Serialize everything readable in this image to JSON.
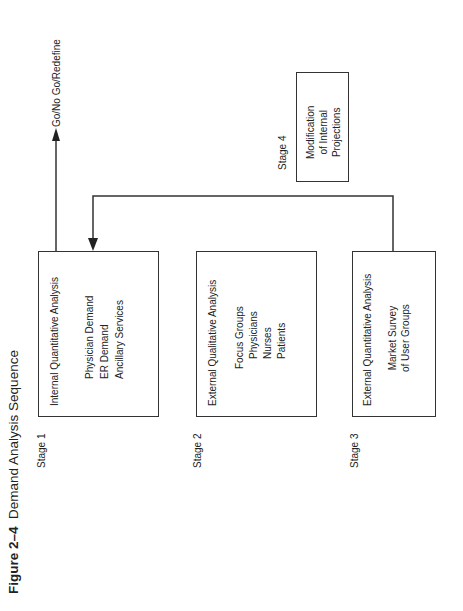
{
  "figure": {
    "number": "Figure 2–4",
    "title": "Demand Analysis Sequence"
  },
  "stages": [
    {
      "label": "Stage 1",
      "heading": "Internal Quantitative Analysis",
      "items": [
        "Physician Demand",
        "ER Demand",
        "Ancillary Services"
      ]
    },
    {
      "label": "Stage 2",
      "heading": "External Qualitative Analysis",
      "items": [
        "Focus Groups",
        "Physicians",
        "Nurses",
        "Patients"
      ]
    },
    {
      "label": "Stage 3",
      "heading": "External Quantitative Analysis",
      "items": [
        "Market Survey",
        "of User Groups"
      ]
    },
    {
      "label": "Stage 4",
      "heading": "",
      "items": [
        "Modification",
        "of Internal",
        "Projections"
      ]
    }
  ],
  "outcome": {
    "label": "Go/No Go/Redefine"
  },
  "colors": {
    "line": "#333333",
    "text": "#222222",
    "background": "#ffffff"
  }
}
